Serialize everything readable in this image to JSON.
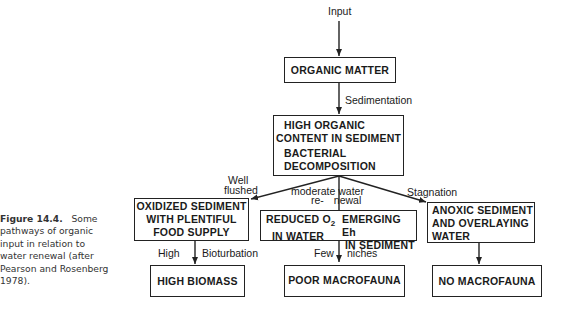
{
  "caption": {
    "figure_label": "Figure 14.4.",
    "text_line1": "Some",
    "text_lines": [
      "pathways of organic",
      "input in relation to",
      "water renewal (after",
      "Pearson and Rosenberg",
      "1978)."
    ]
  },
  "nodes": {
    "input_label": "Input",
    "organic_matter": "ORGANIC MATTER",
    "sedimentation_label": "Sedimentation",
    "high_organic": [
      "HIGH ORGANIC",
      "CONTENT IN SEDIMENT"
    ],
    "bacterial": [
      "BACTERIAL",
      "DECOMPOSITION"
    ],
    "well_flushed": [
      "Well",
      "flushed"
    ],
    "moderate": [
      "moderate water",
      "re-",
      "newal"
    ],
    "stagnation": "Stagnation",
    "oxidized": [
      "OXIDIZED SEDIMENT",
      "WITH PLENTIFUL",
      "FOOD SUPPLY"
    ],
    "reduced": [
      "REDUCED O",
      "2",
      "IN WATER"
    ],
    "emerging": [
      "EMERGING Eh",
      "IN SEDIMENT"
    ],
    "anoxic": [
      "ANOXIC SEDIMENT",
      "AND OVERLAYING",
      "WATER"
    ],
    "high_label": "High",
    "bioturbation_label": "Bioturbation",
    "few_label": "Few",
    "niches_label": "niches",
    "high_biomass": "HIGH BIOMASS",
    "poor_macrofauna": "POOR MACROFAUNA",
    "no_macrofauna": "NO MACROFAUNA"
  },
  "colors": {
    "line": "#222222",
    "text": "#1a1a1a",
    "background": "#ffffff"
  }
}
